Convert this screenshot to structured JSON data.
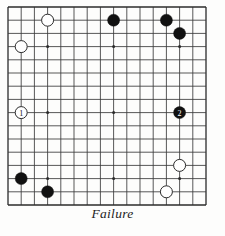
{
  "caption": "Failure",
  "board": {
    "type": "go-board-diagram",
    "cols": 16,
    "rows": 16,
    "line_color": "#3a3a3a",
    "border_color": "#2b2b2b",
    "background_color": "#fdfdfc",
    "black_color": "#111111",
    "white_color": "#ffffff",
    "white_outline_color": "#2b2b2b",
    "geometry": {
      "origin_x": 8,
      "origin_y": 7,
      "spacing": 13.2,
      "stone_radius": 6.0
    },
    "star_points": [
      {
        "col": 3,
        "row": 3
      },
      {
        "col": 3,
        "row": 8
      },
      {
        "col": 3,
        "row": 13
      },
      {
        "col": 8,
        "row": 3
      },
      {
        "col": 8,
        "row": 8
      },
      {
        "col": 8,
        "row": 13
      },
      {
        "col": 13,
        "row": 3
      },
      {
        "col": 13,
        "row": 8
      },
      {
        "col": 13,
        "row": 13
      }
    ],
    "stones": [
      {
        "id": "white-top-left-upper",
        "color": "white",
        "col": 3,
        "row": 1,
        "label": ""
      },
      {
        "id": "white-top-left-lower",
        "color": "white",
        "col": 1,
        "row": 3,
        "label": ""
      },
      {
        "id": "black-top-center",
        "color": "black",
        "col": 8,
        "row": 1,
        "label": ""
      },
      {
        "id": "black-top-right-left",
        "color": "black",
        "col": 12,
        "row": 1,
        "label": ""
      },
      {
        "id": "black-top-right-right",
        "color": "black",
        "col": 13,
        "row": 2,
        "label": ""
      },
      {
        "id": "white-move-1",
        "color": "white",
        "col": 1,
        "row": 8,
        "label": "1"
      },
      {
        "id": "black-move-2",
        "color": "black",
        "col": 13,
        "row": 8,
        "label": "2"
      },
      {
        "id": "black-bottom-left-upper",
        "color": "black",
        "col": 1,
        "row": 13,
        "label": ""
      },
      {
        "id": "black-bottom-left-lower",
        "color": "black",
        "col": 3,
        "row": 14,
        "label": ""
      },
      {
        "id": "white-bottom-right-upper",
        "color": "white",
        "col": 13,
        "row": 12,
        "label": ""
      },
      {
        "id": "white-bottom-right-lower",
        "color": "white",
        "col": 12,
        "row": 14,
        "label": ""
      }
    ]
  }
}
